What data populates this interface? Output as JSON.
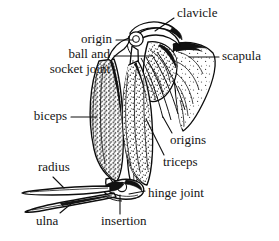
{
  "figure": {
    "background_color": "#ffffff",
    "ink_color": "#111111",
    "width": 279,
    "height": 241
  },
  "labels": [
    {
      "id": "clavicle",
      "text": "clavicle",
      "x": 177,
      "y": 14,
      "anchor": "start",
      "leader": "M 174 18 L 155 31"
    },
    {
      "id": "origin",
      "text": "origin",
      "x": 112,
      "y": 40,
      "anchor": "end",
      "leader": "M 116 40 L 133 40"
    },
    {
      "id": "ball-and-socket-joint-line1",
      "text": "ball and",
      "x": 110,
      "y": 55,
      "anchor": "end",
      "leader": "M 114 56 L 152 56"
    },
    {
      "id": "ball-and-socket-joint-line2",
      "text": "socket joint",
      "x": 110,
      "y": 70,
      "anchor": "end",
      "leader": ""
    },
    {
      "id": "scapula",
      "text": "scapula",
      "x": 222,
      "y": 57,
      "anchor": "start",
      "leader": "M 219 57 L 189 57"
    },
    {
      "id": "biceps",
      "text": "biceps",
      "x": 67,
      "y": 117,
      "anchor": "end",
      "leader": "M 71 117 L 97 117"
    },
    {
      "id": "origins",
      "text": "origins",
      "x": 170,
      "y": 141,
      "anchor": "start",
      "leader": "M 172 133 L 163 117"
    },
    {
      "id": "triceps",
      "text": "triceps",
      "x": 163,
      "y": 163,
      "anchor": "start",
      "leader": "M 164 155 L 146 119"
    },
    {
      "id": "radius",
      "text": "radius",
      "x": 38,
      "y": 168,
      "anchor": "start",
      "leader": "M 53 177 L 64 188"
    },
    {
      "id": "hinge-joint",
      "text": "hinge joint",
      "x": 148,
      "y": 194,
      "anchor": "start",
      "leader": "M 145 191 L 129 194"
    },
    {
      "id": "ulna",
      "text": "ulna",
      "x": 36,
      "y": 222,
      "anchor": "start",
      "leader": "M 60 213 L 72 203"
    },
    {
      "id": "insertion",
      "text": "insertion",
      "x": 101,
      "y": 222,
      "anchor": "start",
      "leader": "M 120 214 L 120 195"
    }
  ],
  "anatomy_parts": [
    {
      "id": "clavicle-bone",
      "name": "clavicle"
    },
    {
      "id": "scapula-blade",
      "name": "scapula"
    },
    {
      "id": "humeral-head",
      "name": "ball of ball-and-socket joint"
    },
    {
      "id": "humerus-shaft",
      "name": "humerus"
    },
    {
      "id": "biceps-muscle",
      "name": "biceps"
    },
    {
      "id": "triceps-muscle",
      "name": "triceps"
    },
    {
      "id": "radius-bone",
      "name": "radius"
    },
    {
      "id": "ulna-bone",
      "name": "ulna"
    },
    {
      "id": "elbow-joint",
      "name": "hinge joint"
    },
    {
      "id": "tendon-insertion",
      "name": "insertion"
    },
    {
      "id": "tendon-origins",
      "name": "origins"
    }
  ]
}
